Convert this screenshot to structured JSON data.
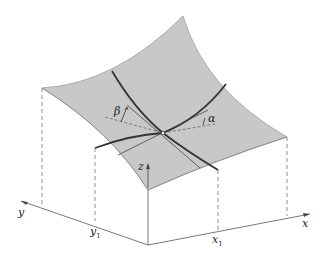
{
  "diagram": {
    "type": "3d-surface-directional-derivative",
    "labels": {
      "x_axis": "x",
      "y_axis": "y",
      "z_axis": "z",
      "x1": "x",
      "x1_sub": "1",
      "y1": "y",
      "y1_sub": "1",
      "alpha": "α",
      "beta": "β"
    },
    "colors": {
      "surface": "#c8c8c8",
      "curve": "#333333",
      "axis": "#555555",
      "dashed": "#777777"
    }
  }
}
